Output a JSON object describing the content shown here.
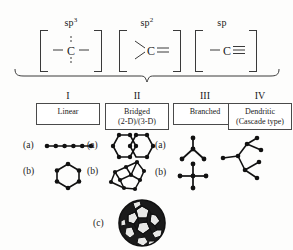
{
  "hybridization": {
    "items": [
      {
        "name": "sp3",
        "label_base": "sp",
        "label_sup": "3",
        "formula": "–C–",
        "center": "C",
        "bond_left": "single",
        "bond_right": "single",
        "bond_up": "dashed",
        "bond_down": "dashed"
      },
      {
        "name": "sp2",
        "label_base": "sp",
        "label_sup": "2",
        "formula": ">C=",
        "center": "C",
        "bond_left": "two-angled",
        "bond_right": "double"
      },
      {
        "name": "sp",
        "label_base": "sp",
        "label_sup": "",
        "formula": "–C≡",
        "center": "C",
        "bond_left": "single",
        "bond_right": "triple"
      }
    ]
  },
  "brace": {
    "name": "grouping-brace",
    "orientation": "horizontal-down"
  },
  "categories": [
    {
      "numeral": "I",
      "title": "Linear",
      "subtitle": ""
    },
    {
      "numeral": "II",
      "title": "Bridged",
      "subtitle": "(2-D)/(3-D)"
    },
    {
      "numeral": "III",
      "title": "Branched",
      "subtitle": ""
    },
    {
      "numeral": "IV",
      "title": "Dendritic",
      "subtitle": "(Cascade type)"
    }
  ],
  "structures": {
    "column_1": [
      {
        "key": "(a)",
        "name": "linear-chain",
        "description": "linear chain of six nodes"
      },
      {
        "key": "(b)",
        "name": "hexagon-ring",
        "description": "six-membered ring"
      }
    ],
    "column_2": [
      {
        "key": "(a)",
        "name": "fused-bicyclic-2d",
        "description": "two fused hexagons (2-D bridged)"
      },
      {
        "key": "(b)",
        "name": "cage-3d",
        "description": "three-dimensional bridged cage"
      }
    ],
    "column_3": [
      {
        "key": "(a)",
        "name": "three-branch-node",
        "description": "trivalent branch point"
      },
      {
        "key": "(b)",
        "name": "four-branch-node",
        "description": "tetravalent cross branch point"
      }
    ],
    "column_4": [
      {
        "key": "",
        "name": "dendrimer-tree",
        "description": "dendritic cascade branching tree"
      }
    ],
    "fullerene": {
      "key": "(c)",
      "name": "fullerene-c60",
      "description": "closed carbon cage (buckminsterfullerene)"
    }
  },
  "colors": {
    "ink": "#1a1a1a",
    "line": "#3a3a3a",
    "box_border": "#4a4a4a",
    "background": "#fdfdfc",
    "node": "#111111"
  }
}
